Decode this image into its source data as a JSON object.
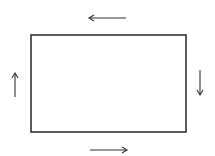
{
  "diagram": {
    "stroke_color": "#333333",
    "background": "#ffffff",
    "rectangle": {
      "x": 31,
      "y": 35,
      "width": 155,
      "height": 97
    },
    "arrows": [
      {
        "id": "top",
        "direction": "left",
        "x1": 126,
        "y1": 18,
        "x2": 89,
        "y2": 18
      },
      {
        "id": "right",
        "direction": "down",
        "x1": 200,
        "y1": 70,
        "x2": 200,
        "y2": 95
      },
      {
        "id": "bottom",
        "direction": "right",
        "x1": 90,
        "y1": 150,
        "x2": 127,
        "y2": 150
      },
      {
        "id": "left",
        "direction": "up",
        "x1": 15,
        "y1": 97,
        "x2": 15,
        "y2": 73
      }
    ]
  }
}
